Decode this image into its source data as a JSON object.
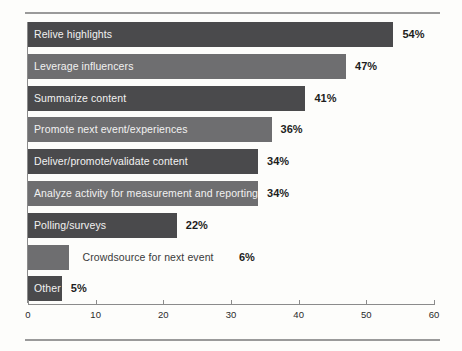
{
  "chart_data": {
    "type": "bar",
    "orientation": "horizontal",
    "title": "",
    "subtitle": "",
    "xlabel": "",
    "ylabel": "",
    "xlim": [
      0,
      60
    ],
    "grid": false,
    "legend": false,
    "xticks": [
      0,
      10,
      20,
      30,
      40,
      50,
      60
    ],
    "xtick_labels": [
      "0",
      "10",
      "20",
      "30",
      "40",
      "50",
      "60"
    ],
    "value_suffix": "%",
    "categories": [
      "Relive highlights",
      "Leverage influencers",
      "Summarize content",
      "Promote next event/experiences",
      "Deliver/promote/validate content",
      "Analyze activity for measurement and reporting",
      "Polling/surveys",
      "Crowdsource for next event",
      "Other"
    ],
    "values": [
      54,
      47,
      41,
      36,
      34,
      34,
      22,
      6,
      5
    ],
    "value_labels": [
      "54%",
      "47%",
      "41%",
      "36%",
      "34%",
      "34%",
      "22%",
      "6%",
      "5%"
    ],
    "bars": [
      {
        "label": "Relive highlights",
        "value": 54,
        "value_label": "54%",
        "color": "#4a4a4c",
        "label_inside": true
      },
      {
        "label": "Leverage influencers",
        "value": 47,
        "value_label": "47%",
        "color": "#6e6e70",
        "label_inside": true
      },
      {
        "label": "Summarize content",
        "value": 41,
        "value_label": "41%",
        "color": "#4a4a4c",
        "label_inside": true
      },
      {
        "label": "Promote next event/experiences",
        "value": 36,
        "value_label": "36%",
        "color": "#6e6e70",
        "label_inside": true
      },
      {
        "label": "Deliver/promote/validate content",
        "value": 34,
        "value_label": "34%",
        "color": "#4a4a4c",
        "label_inside": true
      },
      {
        "label": "Analyze activity for measurement and reporting",
        "value": 34,
        "value_label": "34%",
        "color": "#6e6e70",
        "label_inside": true
      },
      {
        "label": "Polling/surveys",
        "value": 22,
        "value_label": "22%",
        "color": "#4a4a4c",
        "label_inside": true
      },
      {
        "label": "Crowdsource for next event",
        "value": 6,
        "value_label": "6%",
        "color": "#6e6e70",
        "label_inside": false
      },
      {
        "label": "Other",
        "value": 5,
        "value_label": "5%",
        "color": "#4a4a4c",
        "label_inside": true
      }
    ],
    "colors": {
      "bar_dark": "#4a4a4c",
      "bar_medium": "#6e6e70",
      "background": "#fdfdfb",
      "axis": "#8b8b8b",
      "rule": "#9a9a9a",
      "label_inside": "#f2f2f2",
      "label_outside": "#3a3a3a",
      "value_text": "#1d1d1d"
    }
  }
}
